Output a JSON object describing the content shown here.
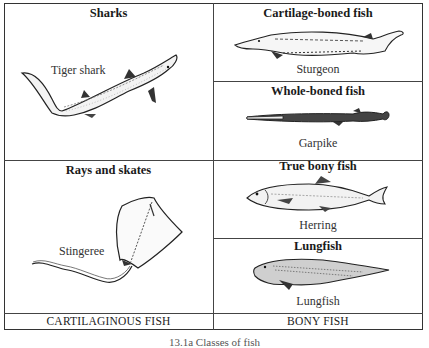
{
  "figure": {
    "caption": "13.1a  Classes of fish",
    "columns": [
      {
        "footer": "CARTILAGINOUS FISH",
        "groups": [
          {
            "title": "Sharks",
            "example": "Tiger shark",
            "icon": "tiger-shark-illustration"
          },
          {
            "title": "Rays and skates",
            "example": "Stingeree",
            "icon": "stingray-illustration"
          }
        ]
      },
      {
        "footer": "BONY FISH",
        "groups": [
          {
            "title": "Cartilage-boned fish",
            "example": "Sturgeon",
            "icon": "sturgeon-illustration"
          },
          {
            "title": "Whole-boned fish",
            "example": "Garpike",
            "icon": "garpike-illustration"
          },
          {
            "title": "True bony fish",
            "example": "Herring",
            "icon": "herring-illustration"
          },
          {
            "title": "Lungfish",
            "example": "Lungfish",
            "icon": "lungfish-illustration"
          }
        ]
      }
    ],
    "colors": {
      "line": "#333333",
      "ink": "#1a1a1a",
      "background": "#ffffff"
    }
  }
}
